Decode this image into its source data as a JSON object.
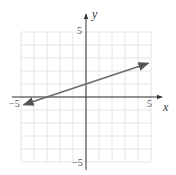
{
  "chart_data": {
    "type": "line",
    "title": "",
    "xlabel": "x",
    "ylabel": "y",
    "xlim": [
      -5,
      5
    ],
    "ylim": [
      -5,
      5
    ],
    "grid": true,
    "x_tick_labels": [
      "-5",
      "5"
    ],
    "y_tick_labels": [
      "5",
      "-5"
    ],
    "series": [
      {
        "name": "y = (1/3)x + 1",
        "equation": "y = x/3 + 1",
        "slope": 0.3333,
        "intercept": 1,
        "x": [
          -4.8,
          4.8
        ],
        "y": [
          -0.6,
          2.6
        ],
        "arrows_both_ends": true
      }
    ],
    "colors": {
      "line": "#6b6b6b",
      "axis": "#333333",
      "grid": "#e4e4e4"
    }
  },
  "labels": {
    "x_axis": "x",
    "y_axis": "y",
    "x_min": "−5",
    "x_max": "5",
    "y_max": "5",
    "y_min": "−5"
  }
}
